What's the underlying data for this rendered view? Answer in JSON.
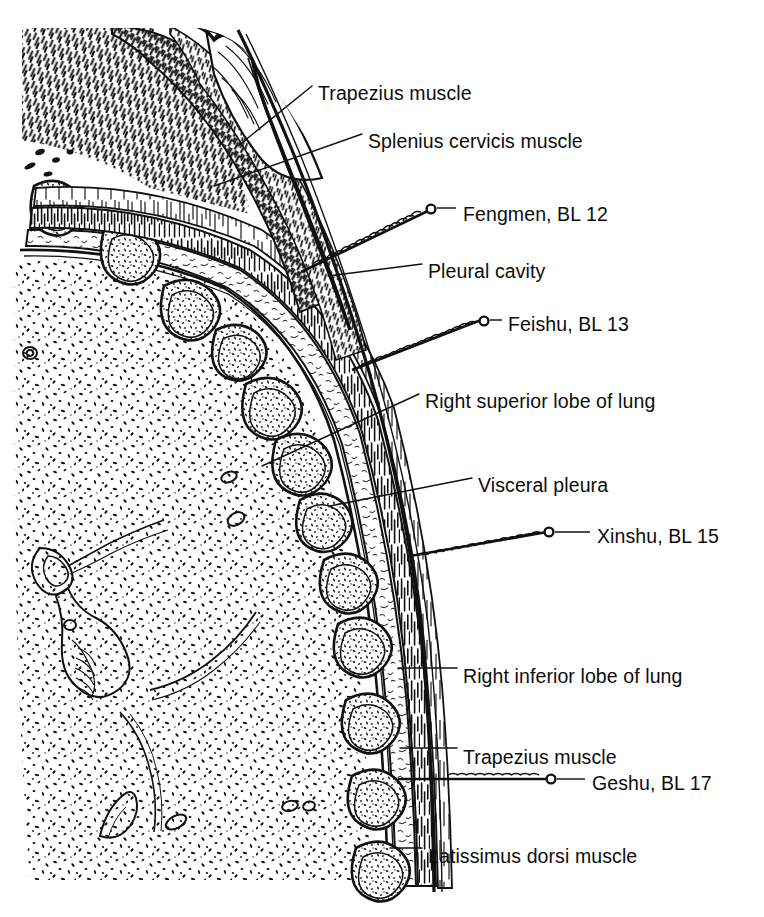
{
  "figure": {
    "type": "anatomical-illustration",
    "style": "pen-and-ink line drawing, stippled and hatched",
    "background_color": "#ffffff",
    "ink_color": "#111111",
    "leader_line_color": "#111111"
  },
  "labels": [
    {
      "id": "trapezius-upper",
      "text": "Trapezius muscle",
      "x": 318,
      "y": 82,
      "kind": "anatomy"
    },
    {
      "id": "splenius-cervicis",
      "text": "Splenius cervicis muscle",
      "x": 368,
      "y": 130,
      "kind": "anatomy"
    },
    {
      "id": "fengmen",
      "text": "Fengmen, BL 12",
      "x": 463,
      "y": 203,
      "kind": "acupoint"
    },
    {
      "id": "pleural-cavity",
      "text": "Pleural cavity",
      "x": 428,
      "y": 260,
      "kind": "anatomy"
    },
    {
      "id": "feishu",
      "text": "Feishu, BL 13",
      "x": 508,
      "y": 313,
      "kind": "acupoint"
    },
    {
      "id": "right-superior-lobe",
      "text": "Right superior lobe of lung",
      "x": 425,
      "y": 390,
      "kind": "anatomy"
    },
    {
      "id": "visceral-pleura",
      "text": "Visceral pleura",
      "x": 478,
      "y": 474,
      "kind": "anatomy"
    },
    {
      "id": "xinshu",
      "text": "Xinshu, BL 15",
      "x": 597,
      "y": 525,
      "kind": "acupoint"
    },
    {
      "id": "right-inferior-lobe",
      "text": "Right inferior lobe of lung",
      "x": 463,
      "y": 665,
      "kind": "anatomy"
    },
    {
      "id": "trapezius-lower",
      "text": "Trapezius muscle",
      "x": 463,
      "y": 746,
      "kind": "anatomy"
    },
    {
      "id": "geshu",
      "text": "Geshu, BL 17",
      "x": 592,
      "y": 772,
      "kind": "acupoint"
    },
    {
      "id": "latissimus-dorsi",
      "text": "Latissimus dorsi muscle",
      "x": 428,
      "y": 845,
      "kind": "anatomy"
    }
  ],
  "acupoints": [
    {
      "name": "Fengmen",
      "code": "BL 12",
      "needle": "inserted obliquely, handle up-right"
    },
    {
      "name": "Feishu",
      "code": "BL 13",
      "needle": "inserted obliquely, handle up-right"
    },
    {
      "name": "Xinshu",
      "code": "BL 15",
      "needle": "inserted obliquely, handle up-right"
    },
    {
      "name": "Geshu",
      "code": "BL 17",
      "needle": "inserted horizontally"
    }
  ],
  "structures": [
    "Trapezius muscle",
    "Splenius cervicis muscle",
    "Pleural cavity",
    "Right superior lobe of lung",
    "Visceral pleura",
    "Right inferior lobe of lung",
    "Latissimus dorsi muscle",
    "Ribs in cross-section",
    "Intercostal muscles",
    "Skin and subcutaneous tissue"
  ]
}
